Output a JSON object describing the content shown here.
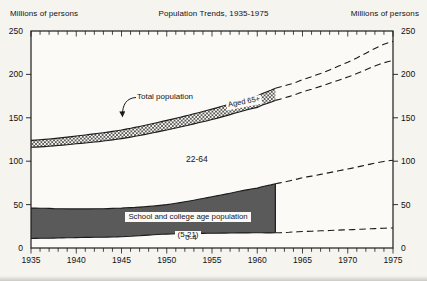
{
  "header": {
    "left_unit": "Millions of persons",
    "title": "Population Trends, 1935-1975",
    "right_unit": "Millions of persons"
  },
  "annotations": {
    "total_population": "Total population",
    "aged_65": "Aged 65+",
    "age_22_64": "22-64",
    "school_line1": "School and college age population",
    "school_line2": "(5-21)",
    "age_0_4": "0-4"
  },
  "colors": {
    "page_bg": "#f5f4ef",
    "plot_bg": "#fbfaf6",
    "line": "#1b1b1b",
    "band_dark": "#5a5a5a",
    "hatch_stroke": "#2b2b2b",
    "text": "#111111"
  },
  "chart_data": {
    "type": "area",
    "title": "Population Trends, 1935-1975",
    "unit": "Millions of persons",
    "xlim": [
      1935,
      1975
    ],
    "ylim": [
      0,
      250
    ],
    "x_tick_labels": [
      1935,
      1940,
      1945,
      1950,
      1955,
      1960,
      1965,
      1970,
      1975
    ],
    "minor_x_tick_interval_years": 1,
    "y_tick_labels": [
      0,
      50,
      100,
      150,
      200,
      250
    ],
    "grid": false,
    "projection_start_year": 1962,
    "projection_style": "dashed",
    "x": [
      1935,
      1940,
      1945,
      1950,
      1955,
      1960,
      1962,
      1965,
      1970,
      1975
    ],
    "series": [
      {
        "name": "Total population",
        "role": "total-population-line",
        "values": [
          124,
          129,
          136,
          147,
          160,
          175,
          184,
          194,
          214,
          238
        ]
      },
      {
        "name": "Aged 65+ lower boundary (top of 22-64 region)",
        "role": "aged-65-lower-boundary",
        "values": [
          116,
          120,
          126,
          136,
          148,
          162,
          170,
          180,
          197,
          216
        ]
      },
      {
        "name": "School and college age (5-21) upper boundary",
        "role": "age-5-21-upper-boundary",
        "values": [
          46,
          45,
          46,
          50,
          59,
          69,
          74,
          81,
          91,
          101
        ]
      },
      {
        "name": "0-4 upper boundary",
        "role": "age-0-4-upper-boundary",
        "values": [
          11,
          12,
          13,
          16,
          17,
          17.5,
          17.5,
          19,
          21,
          23
        ]
      }
    ],
    "bands": [
      {
        "label": "Aged 65+",
        "between": [
          "Total population",
          "Aged 65+ lower boundary"
        ],
        "fill": "crosshatch"
      },
      {
        "label": "22-64",
        "between": [
          "Aged 65+ lower boundary",
          "School and college age (5-21) upper boundary"
        ],
        "fill": "white"
      },
      {
        "label": "School and college age population (5-21)",
        "between": [
          "School and college age (5-21) upper boundary",
          "0-4 upper boundary"
        ],
        "fill": "dark-gray"
      },
      {
        "label": "0-4",
        "between": [
          "0-4 upper boundary",
          "baseline 0"
        ],
        "fill": "white"
      }
    ]
  }
}
